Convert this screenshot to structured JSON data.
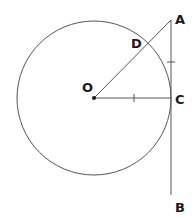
{
  "diagram": {
    "type": "geometry",
    "colors": {
      "stroke": "#555555",
      "text": "#1a1a1a",
      "background": "#ffffff"
    },
    "points": {
      "O": {
        "label": "O",
        "x": 94,
        "y": 98
      },
      "A": {
        "label": "A",
        "x": 171,
        "y": 20
      },
      "B": {
        "label": "B",
        "x": 171,
        "y": 195
      },
      "C": {
        "label": "C",
        "x": 171,
        "y": 98
      },
      "D": {
        "label": "D",
        "x": 147,
        "y": 44
      }
    },
    "circle": {
      "center": "O",
      "radius": 77
    },
    "segments": [
      "OA",
      "OC",
      "AB"
    ],
    "equal_marks": [
      "OC",
      "AC"
    ]
  }
}
